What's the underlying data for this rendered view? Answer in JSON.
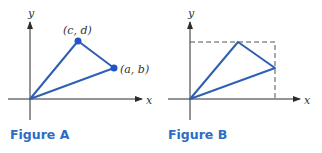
{
  "figures": [
    {
      "id": "A",
      "caption": "Figure A",
      "axis_labels": {
        "x": "x",
        "y": "y"
      },
      "points": [
        {
          "name": "origin",
          "label": ""
        },
        {
          "name": "cd",
          "label": "(c, d)"
        },
        {
          "name": "ab",
          "label": "(a, b)"
        }
      ],
      "shows_points": true,
      "shows_bounding_box": false
    },
    {
      "id": "B",
      "caption": "Figure B",
      "axis_labels": {
        "x": "x",
        "y": "y"
      },
      "shows_points": false,
      "shows_bounding_box": true
    }
  ],
  "colors": {
    "triangle": "#2f5fb4",
    "point": "#1f55c4",
    "caption": "#2d6cc6",
    "axis": "#2b2b2b",
    "dashed_box": "#555555"
  }
}
